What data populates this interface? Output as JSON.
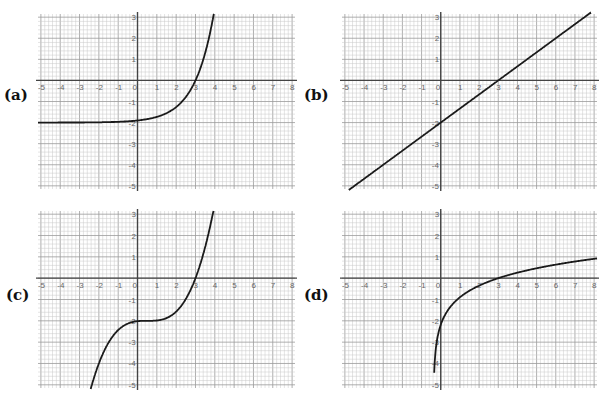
{
  "chart_data": [
    {
      "id": "a",
      "label": "(a)",
      "type": "line",
      "title": "",
      "xlabel": "",
      "ylabel": "",
      "xlim": [
        -5,
        8
      ],
      "ylim": [
        -5,
        3
      ],
      "x_ticks": [
        -5,
        -4,
        -3,
        -2,
        -1,
        0,
        1,
        2,
        3,
        4,
        5,
        6,
        7,
        8
      ],
      "y_ticks": [
        3,
        2,
        1,
        -1,
        -2,
        -3,
        -4,
        -5
      ],
      "grid": true,
      "curve": {
        "kind": "exp",
        "description": "exponential growth, asymptote near y=-2, y-intercept -2, x-intercept 3",
        "a": 2,
        "b": 3,
        "c": -2
      },
      "key_points": [
        [
          -5,
          -2.0
        ],
        [
          0,
          -1.9
        ],
        [
          2,
          -1.26
        ],
        [
          3,
          0
        ],
        [
          3.5,
          1.3
        ],
        [
          3.9,
          2.9
        ]
      ]
    },
    {
      "id": "b",
      "label": "(b)",
      "type": "line",
      "title": "",
      "xlabel": "",
      "ylabel": "",
      "xlim": [
        -5,
        8
      ],
      "ylim": [
        -5,
        3
      ],
      "x_ticks": [
        -5,
        -4,
        -3,
        -2,
        -1,
        0,
        1,
        2,
        3,
        4,
        5,
        6,
        7,
        8
      ],
      "y_ticks": [
        3,
        2,
        1,
        -1,
        -2,
        -3,
        -4,
        -5
      ],
      "grid": true,
      "curve": {
        "kind": "linear",
        "description": "straight line through (0,-2) and (3,0)",
        "m": 0.6667,
        "c": -2
      },
      "key_points": [
        [
          -4.5,
          -5
        ],
        [
          0,
          -2
        ],
        [
          3,
          0
        ],
        [
          6,
          2
        ],
        [
          7.5,
          3
        ]
      ]
    },
    {
      "id": "c",
      "label": "(c)",
      "type": "line",
      "title": "",
      "xlabel": "",
      "ylabel": "",
      "xlim": [
        -5,
        8
      ],
      "ylim": [
        -5,
        3
      ],
      "x_ticks": [
        -5,
        -4,
        -3,
        -2,
        -1,
        0,
        1,
        2,
        3,
        4,
        5,
        6,
        7,
        8
      ],
      "y_ticks": [
        3,
        2,
        1,
        -1,
        -2,
        -3,
        -4,
        -5
      ],
      "grid": true,
      "curve": {
        "kind": "cubic",
        "description": "cubic with flat inflection near y=-2, x-intercept 3",
        "k": 0.128,
        "h": 0.5,
        "c": -2
      },
      "key_points": [
        [
          -2.4,
          -5
        ],
        [
          -1,
          -2.4
        ],
        [
          0,
          -2
        ],
        [
          1,
          -2
        ],
        [
          2,
          -1.6
        ],
        [
          3,
          0
        ],
        [
          3.9,
          3
        ]
      ]
    },
    {
      "id": "d",
      "label": "(d)",
      "type": "line",
      "title": "",
      "xlabel": "",
      "ylabel": "",
      "xlim": [
        -5,
        8
      ],
      "ylim": [
        -5,
        3
      ],
      "x_ticks": [
        -5,
        -4,
        -3,
        -2,
        -1,
        0,
        1,
        2,
        3,
        4,
        5,
        6,
        7,
        8
      ],
      "y_ticks": [
        3,
        2,
        1,
        -1,
        -2,
        -3,
        -4,
        -5
      ],
      "grid": true,
      "curve": {
        "kind": "log",
        "description": "logarithmic curve, vertical asymptote near x=-0.4, x-intercept 3",
        "h": 0.38,
        "d": 3.38
      },
      "key_points": [
        [
          -0.35,
          -5
        ],
        [
          0,
          -2
        ],
        [
          1,
          -0.9
        ],
        [
          2,
          -0.35
        ],
        [
          3,
          0
        ],
        [
          5,
          0.5
        ],
        [
          8,
          0.95
        ]
      ]
    }
  ],
  "panels": [
    {
      "id": "a",
      "label": "(a)"
    },
    {
      "id": "b",
      "label": "(b)"
    },
    {
      "id": "c",
      "label": "(c)"
    },
    {
      "id": "d",
      "label": "(d)"
    }
  ],
  "colors": {
    "grid_minor": "#c8c8c8",
    "grid_major": "#9a9a9a",
    "axis": "#444444",
    "curve": "#1a1a1a",
    "tick_label": "#666666"
  }
}
